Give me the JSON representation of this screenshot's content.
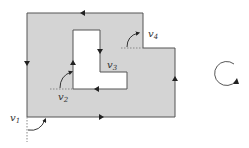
{
  "diagram": {
    "type": "polygon-with-hole-traversal",
    "colors": {
      "fill": "#d4d4d4",
      "stroke": "#555555",
      "hole": "#ffffff",
      "dotted": "#888888",
      "arrow": "#222222"
    },
    "labels": {
      "v1": {
        "base": "v",
        "sub": "1"
      },
      "v2": {
        "base": "v",
        "sub": "2"
      },
      "v3": {
        "base": "v",
        "sub": "3"
      },
      "v4": {
        "base": "v",
        "sub": "4"
      }
    },
    "rotation_indicator": "counterclockwise"
  }
}
